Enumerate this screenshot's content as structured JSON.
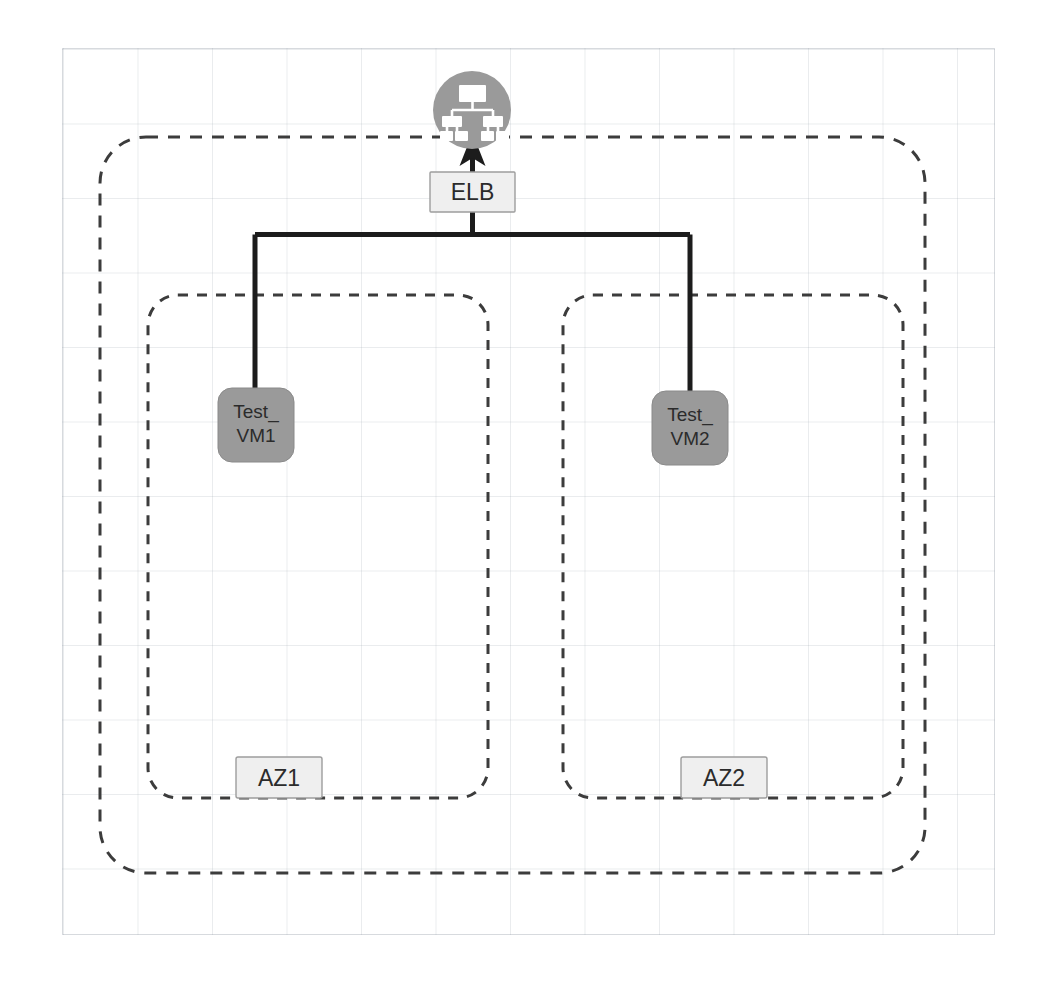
{
  "diagram": {
    "canvas": {
      "background": "#ffffff",
      "grid_color": "#96a0aa"
    },
    "internet": {
      "icon": "network-hierarchy-cloud-icon",
      "color": "#9a9a9a"
    },
    "elb": {
      "label": "ELB",
      "fill": "#efefef",
      "stroke": "#9d9d9d"
    },
    "region": {
      "stroke": "#3c3c3c",
      "style": "dashed"
    },
    "zones": [
      {
        "id": "az1",
        "label": "AZ1",
        "instance": {
          "name_line1": "Test_",
          "name_line2": "VM1",
          "fill": "#9a9a9a"
        }
      },
      {
        "id": "az2",
        "label": "AZ2",
        "instance": {
          "name_line1": "Test_",
          "name_line2": "VM2",
          "fill": "#9a9a9a"
        }
      }
    ],
    "connections": [
      {
        "from": "elb",
        "to": "internet",
        "arrow": true
      },
      {
        "from": "elb",
        "to": "az1.instance",
        "arrow": false
      },
      {
        "from": "elb",
        "to": "az2.instance",
        "arrow": false
      }
    ]
  }
}
